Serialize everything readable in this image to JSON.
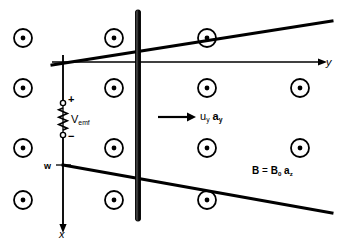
{
  "figure": {
    "canvas": {
      "width": 349,
      "height": 246,
      "background": "#ffffff"
    },
    "ink_color": "#000000"
  },
  "axes": {
    "horizontal": {
      "label": "y",
      "label_x": 326,
      "label_y": 57,
      "x_start": 52,
      "x_end": 318,
      "y": 62
    },
    "vertical": {
      "label": "x",
      "label_x": 59,
      "label_y": 229,
      "x": 63,
      "y_start": 55,
      "y_end": 224
    }
  },
  "rails": {
    "top": {
      "x1": 52,
      "y1": 65,
      "x2": 332,
      "y2": 21,
      "width": 3
    },
    "bottom": {
      "x1": 63,
      "y1": 165,
      "x2": 332,
      "y2": 213,
      "width": 3
    }
  },
  "sliding_bar": {
    "name": "sliding-conducting-bar",
    "x": 138,
    "y_top": 10,
    "y_bottom": 221,
    "width": 5
  },
  "field_symbols": {
    "legend": "dot-in-circle means B field out of the page",
    "outer_radius": 9,
    "inner_radius": 2.4,
    "positions": [
      {
        "x": 23,
        "y": 38
      },
      {
        "x": 114,
        "y": 38
      },
      {
        "x": 207,
        "y": 38
      },
      {
        "x": 23,
        "y": 88
      },
      {
        "x": 114,
        "y": 88
      },
      {
        "x": 207,
        "y": 88
      },
      {
        "x": 300,
        "y": 88
      },
      {
        "x": 23,
        "y": 148
      },
      {
        "x": 114,
        "y": 148
      },
      {
        "x": 207,
        "y": 148
      },
      {
        "x": 300,
        "y": 148
      },
      {
        "x": 23,
        "y": 200
      },
      {
        "x": 114,
        "y": 200
      },
      {
        "x": 207,
        "y": 200
      }
    ]
  },
  "source": {
    "name": "emf-source",
    "label": "V",
    "label_sub": "emf",
    "plus_sign": "+",
    "minus_sign": "−",
    "terminal_top_y": 103,
    "terminal_bottom_y": 135,
    "x": 63,
    "zigzag_count": 6
  },
  "velocity": {
    "label_u": "u",
    "label_u_sub": "y",
    "label_a": "a",
    "label_a_sub": "y",
    "arrow_x1": 158,
    "arrow_x2": 196,
    "arrow_y": 117,
    "label_x": 200,
    "label_y": 111
  },
  "width_marker": {
    "label": "w",
    "label_x": 44,
    "label_y": 162,
    "tick_x1": 56,
    "tick_x2": 71,
    "tick_y": 165
  },
  "field_annotation": {
    "b_bold": "B",
    "equals": "=",
    "b0": "B",
    "b0_sub": "0",
    "a_bold": "a",
    "a_sub": "z",
    "x": 252,
    "y": 166
  }
}
